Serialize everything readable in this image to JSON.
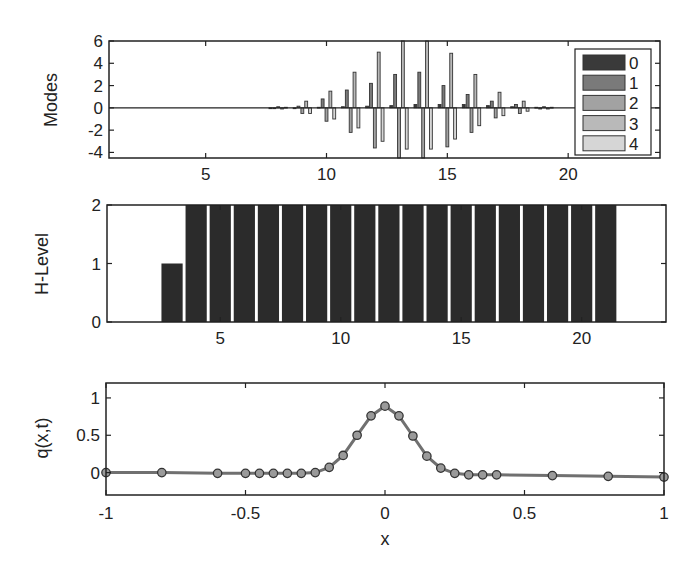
{
  "chart_data": [
    {
      "type": "bar",
      "name": "modes",
      "ylabel": "Modes",
      "xlabel": "",
      "xlim": [
        1,
        23.8
      ],
      "ylim": [
        -4.5,
        6
      ],
      "xticks": [
        5,
        10,
        15,
        20
      ],
      "yticks": [
        -4,
        -2,
        0,
        2,
        4,
        6
      ],
      "grid": false,
      "legend": {
        "placement": "right",
        "entries": [
          "0",
          "1",
          "2",
          "3",
          "4"
        ]
      },
      "series_colors": [
        "#3a3a3a",
        "#7a7a7a",
        "#a2a2a2",
        "#b9b9b9",
        "#d6d6d6"
      ],
      "groups": [
        {
          "x": 8,
          "values": [
            0,
            -0.05,
            0.1,
            -0.1,
            0.05
          ]
        },
        {
          "x": 9,
          "values": [
            0,
            0.15,
            -0.5,
            0.6,
            -0.5
          ]
        },
        {
          "x": 10,
          "values": [
            0.05,
            0.8,
            -1.2,
            1.5,
            -1.0
          ]
        },
        {
          "x": 11,
          "values": [
            0.1,
            1.6,
            -2.2,
            3.2,
            -1.8
          ]
        },
        {
          "x": 12,
          "values": [
            0.15,
            2.2,
            -3.6,
            5.0,
            -3.0
          ]
        },
        {
          "x": 13,
          "values": [
            0.2,
            3.0,
            -4.5,
            6.0,
            -3.7
          ]
        },
        {
          "x": 14,
          "values": [
            0.3,
            3.2,
            -4.5,
            6.0,
            -3.7
          ]
        },
        {
          "x": 15,
          "values": [
            0.3,
            2.0,
            -3.5,
            4.9,
            -2.8
          ]
        },
        {
          "x": 16,
          "values": [
            0.3,
            1.2,
            -2.2,
            3.0,
            -1.6
          ]
        },
        {
          "x": 17,
          "values": [
            0.2,
            0.6,
            -0.9,
            1.4,
            -0.7
          ]
        },
        {
          "x": 18,
          "values": [
            0.1,
            0.3,
            -0.5,
            0.6,
            -0.3
          ]
        },
        {
          "x": 19,
          "values": [
            0.05,
            -0.1,
            0.1,
            -0.1,
            0.05
          ]
        }
      ]
    },
    {
      "type": "bar",
      "name": "h-level",
      "ylabel": "H-Level",
      "xlabel": "",
      "xlim": [
        0.3,
        23.5
      ],
      "ylim": [
        0,
        2
      ],
      "xticks": [
        5,
        10,
        15,
        20
      ],
      "yticks": [
        0,
        1,
        2
      ],
      "grid": false,
      "bar_color": "#2b2b2b",
      "categories": [
        3,
        4,
        5,
        6,
        7,
        8,
        9,
        10,
        11,
        12,
        13,
        14,
        15,
        16,
        17,
        18,
        19,
        20,
        21
      ],
      "values": [
        1,
        2,
        2,
        2,
        2,
        2,
        2,
        2,
        2,
        2,
        2,
        2,
        2,
        2,
        2,
        2,
        2,
        2,
        2
      ]
    },
    {
      "type": "line",
      "name": "q-profile",
      "ylabel": "q(x,t)",
      "xlabel": "x",
      "xlim": [
        -1,
        1
      ],
      "ylim": [
        -0.3,
        1.2
      ],
      "xticks": [
        -1,
        -0.5,
        0,
        0.5,
        1
      ],
      "xtick_labels": [
        "-1",
        "-0.5",
        "0",
        "0.5",
        "1"
      ],
      "yticks": [
        0,
        0.5,
        1
      ],
      "ytick_labels": [
        "0",
        "0.5",
        "1"
      ],
      "grid": false,
      "line_color": "#707070",
      "marker": "circle",
      "x": [
        -1,
        -0.8,
        -0.6,
        -0.5,
        -0.45,
        -0.4,
        -0.35,
        -0.3,
        -0.25,
        -0.2,
        -0.15,
        -0.1,
        -0.05,
        0,
        0.05,
        0.1,
        0.15,
        0.2,
        0.25,
        0.3,
        0.35,
        0.4,
        0.6,
        0.8,
        1
      ],
      "y": [
        0.0,
        0.0,
        -0.01,
        -0.01,
        -0.01,
        -0.01,
        -0.01,
        -0.01,
        0.0,
        0.07,
        0.23,
        0.5,
        0.76,
        0.89,
        0.76,
        0.49,
        0.22,
        0.06,
        -0.01,
        -0.03,
        -0.03,
        -0.03,
        -0.04,
        -0.05,
        -0.06
      ]
    }
  ],
  "axes_text": {
    "modes_ylabel": "Modes",
    "hlevel_ylabel": "H-Level",
    "q_ylabel": "q(x,t)",
    "q_xlabel": "x"
  }
}
